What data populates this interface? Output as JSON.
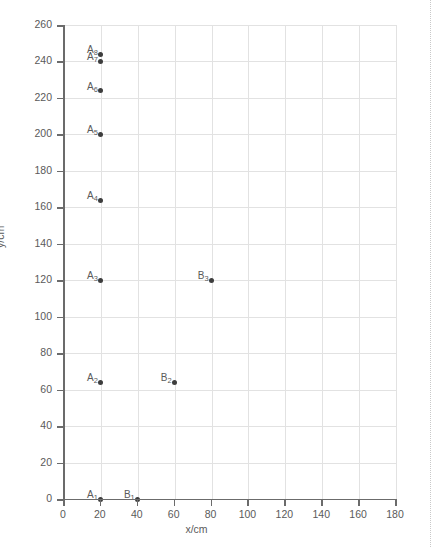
{
  "chart_data": {
    "type": "scatter",
    "title": "",
    "xlabel": "x/cm",
    "ylabel": "y/cm",
    "xlim": [
      0,
      180
    ],
    "ylim": [
      0,
      260
    ],
    "xticks": [
      0,
      20,
      40,
      60,
      80,
      100,
      120,
      140,
      160,
      180
    ],
    "yticks": [
      0,
      20,
      40,
      60,
      80,
      100,
      120,
      140,
      160,
      180,
      200,
      220,
      240,
      260
    ],
    "grid": true,
    "legend": "none",
    "series": [
      {
        "name": "A",
        "points": [
          {
            "label": "A",
            "sub": "1",
            "x": 20,
            "y": 0
          },
          {
            "label": "A",
            "sub": "2",
            "x": 20,
            "y": 64
          },
          {
            "label": "A",
            "sub": "3",
            "x": 20,
            "y": 120
          },
          {
            "label": "A",
            "sub": "4",
            "x": 20,
            "y": 164
          },
          {
            "label": "A",
            "sub": "5",
            "x": 20,
            "y": 200
          },
          {
            "label": "A",
            "sub": "6",
            "x": 20,
            "y": 224
          },
          {
            "label": "A",
            "sub": "7",
            "x": 20,
            "y": 240
          },
          {
            "label": "A",
            "sub": "8",
            "x": 20,
            "y": 244
          }
        ]
      },
      {
        "name": "B",
        "points": [
          {
            "label": "B",
            "sub": "1",
            "x": 40,
            "y": 0
          },
          {
            "label": "B",
            "sub": "2",
            "x": 60,
            "y": 64
          },
          {
            "label": "B",
            "sub": "3",
            "x": 80,
            "y": 120
          }
        ]
      }
    ],
    "marker_color": "#3d3d3d",
    "grid_color": "#e2e2e2",
    "axis_color": "#6b6b6b"
  },
  "caption": ""
}
